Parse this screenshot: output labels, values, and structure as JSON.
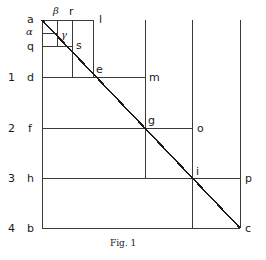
{
  "figure": {
    "caption": "Fig. 1",
    "caption_x": 110,
    "caption_y": 238,
    "stroke_color": "#3a3a3a",
    "diagonal_color": "#1a1a1a",
    "background": "#ffffff",
    "width": 266,
    "height": 260
  },
  "geometry": {
    "origin_x": 42,
    "origin_y": 20,
    "end_x": 240,
    "end_y": 228,
    "vertical_x": [
      42,
      57,
      72,
      93,
      145,
      192,
      240
    ],
    "horizontal_y": [
      20,
      33,
      46,
      77,
      128,
      178,
      228
    ]
  },
  "axis_numbers": [
    {
      "text": "1",
      "x": 8,
      "y": 72
    },
    {
      "text": "2",
      "x": 8,
      "y": 123
    },
    {
      "text": "3",
      "x": 8,
      "y": 173
    },
    {
      "text": "4",
      "x": 8,
      "y": 223
    }
  ],
  "left_labels": [
    {
      "text": "a",
      "x": 27,
      "y": 14
    },
    {
      "text": "q",
      "x": 27,
      "y": 41
    },
    {
      "text": "d",
      "x": 27,
      "y": 72
    },
    {
      "text": "f",
      "x": 28,
      "y": 123
    },
    {
      "text": "h",
      "x": 27,
      "y": 173
    },
    {
      "text": "b",
      "x": 27,
      "y": 223
    }
  ],
  "greek_labels": [
    {
      "text": "α",
      "x": 26,
      "y": 27
    },
    {
      "text": "β",
      "x": 53,
      "y": 6
    },
    {
      "text": "γ",
      "x": 61,
      "y": 30
    }
  ],
  "inner_labels": [
    {
      "text": "r",
      "x": 69,
      "y": 6
    },
    {
      "text": "s",
      "x": 76,
      "y": 40
    }
  ],
  "point_labels": [
    {
      "text": "l",
      "x": 99,
      "y": 14
    },
    {
      "text": "e",
      "x": 96,
      "y": 64
    },
    {
      "text": "m",
      "x": 149,
      "y": 72
    },
    {
      "text": "g",
      "x": 148,
      "y": 115
    },
    {
      "text": "o",
      "x": 197,
      "y": 123
    },
    {
      "text": "i",
      "x": 196,
      "y": 166
    },
    {
      "text": "p",
      "x": 245,
      "y": 173
    },
    {
      "text": "c",
      "x": 245,
      "y": 223
    }
  ]
}
